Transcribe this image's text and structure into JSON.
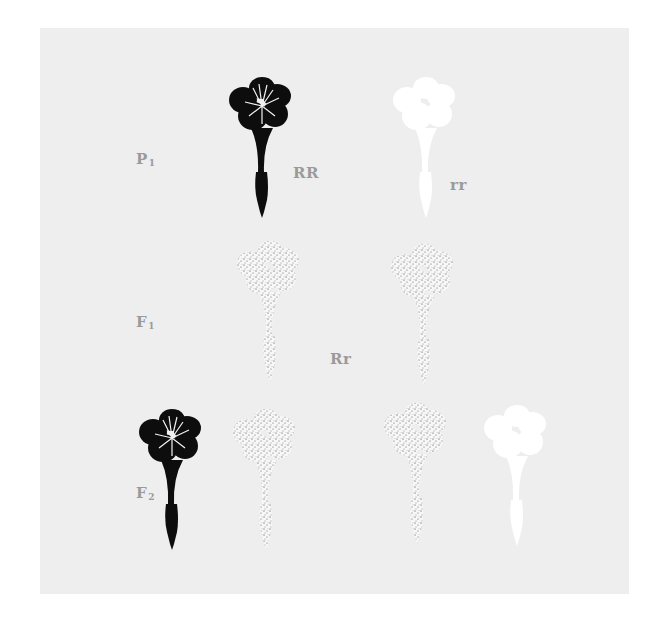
{
  "diagram": {
    "title": "",
    "background_color": "#eeeeee",
    "label_color": "#9a9a9a",
    "generations": [
      {
        "id": "p1",
        "label": "P",
        "subscript": "1",
        "flowers": [
          {
            "phenotype": "red",
            "fill": "dark",
            "genotype": "RR"
          },
          {
            "phenotype": "white",
            "fill": "white",
            "genotype": "rr"
          }
        ]
      },
      {
        "id": "f1",
        "label": "F",
        "subscript": "1",
        "genotype": "Rr",
        "flowers": [
          {
            "phenotype": "pink",
            "fill": "stippled"
          },
          {
            "phenotype": "pink",
            "fill": "stippled"
          }
        ]
      },
      {
        "id": "f2",
        "label": "F",
        "subscript": "2",
        "flowers": [
          {
            "phenotype": "red",
            "fill": "dark"
          },
          {
            "phenotype": "pink",
            "fill": "stippled"
          },
          {
            "phenotype": "pink",
            "fill": "stippled"
          },
          {
            "phenotype": "white",
            "fill": "white"
          }
        ]
      }
    ]
  }
}
